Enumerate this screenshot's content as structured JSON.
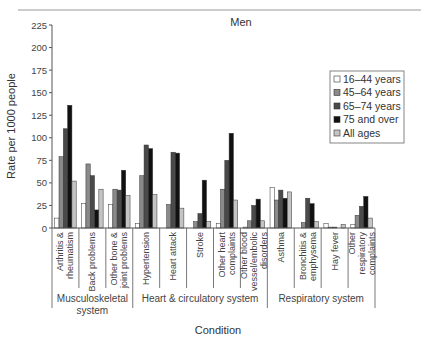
{
  "chart_data": {
    "type": "bar",
    "title": "Men",
    "xlabel": "Condition",
    "ylabel": "Rate per 1000 people",
    "ylim": [
      0,
      225
    ],
    "yticks": [
      0,
      25,
      50,
      75,
      100,
      125,
      150,
      175,
      200,
      225
    ],
    "grid": false,
    "legend_position": "upper right",
    "categories": [
      "Arthritis & rheumatism",
      "Back problems",
      "Other bone & joint problems",
      "Hypertension",
      "Heart attack",
      "Stroke",
      "Other heart complaints",
      "Other blood vessel/embolic disorders",
      "Asthma",
      "Bronchitis & emphysema",
      "Hay fever",
      "Other respiratory complaints"
    ],
    "category_label_lines": [
      [
        "Arthritis &",
        "rheumatism"
      ],
      [
        "Back problems"
      ],
      [
        "Other bone &",
        "joint problems"
      ],
      [
        "Hypertension"
      ],
      [
        "Heart attack"
      ],
      [
        "Stroke"
      ],
      [
        "Other heart",
        "complaints"
      ],
      [
        "Other blood",
        "vessel/embolic",
        "disorders"
      ],
      [
        "Asthma"
      ],
      [
        "Bronchitis &",
        "emphysema"
      ],
      [
        "Hay fever"
      ],
      [
        "Other",
        "respiratory",
        "complaints"
      ]
    ],
    "groups": [
      {
        "label_lines": [
          "Musculoskeletal",
          "system"
        ],
        "start": 0,
        "end": 2
      },
      {
        "label_lines": [
          "Heart & circulatory system"
        ],
        "start": 3,
        "end": 7
      },
      {
        "label_lines": [
          "Respiratory system"
        ],
        "start": 8,
        "end": 11
      }
    ],
    "series": [
      {
        "name": "16–44 years",
        "color": "#ffffff",
        "values": [
          11,
          27,
          26,
          5,
          0,
          0,
          5,
          1,
          45,
          0,
          5,
          4
        ]
      },
      {
        "name": "45–64 years",
        "color": "#8a8a8a",
        "values": [
          79,
          71,
          43,
          58,
          26,
          7,
          43,
          8,
          31,
          6,
          1,
          14
        ]
      },
      {
        "name": "65–74 years",
        "color": "#4a4a4a",
        "values": [
          110,
          58,
          42,
          92,
          84,
          16,
          75,
          25,
          42,
          33,
          1,
          24
        ]
      },
      {
        "name": "75 and over",
        "color": "#111111",
        "values": [
          136,
          20,
          64,
          88,
          83,
          53,
          105,
          32,
          33,
          27,
          0,
          35
        ]
      },
      {
        "name": "All ages",
        "color": "#c4c4c4",
        "values": [
          52,
          43,
          36,
          37,
          22,
          7,
          31,
          8,
          40,
          7,
          4,
          11
        ]
      }
    ]
  }
}
